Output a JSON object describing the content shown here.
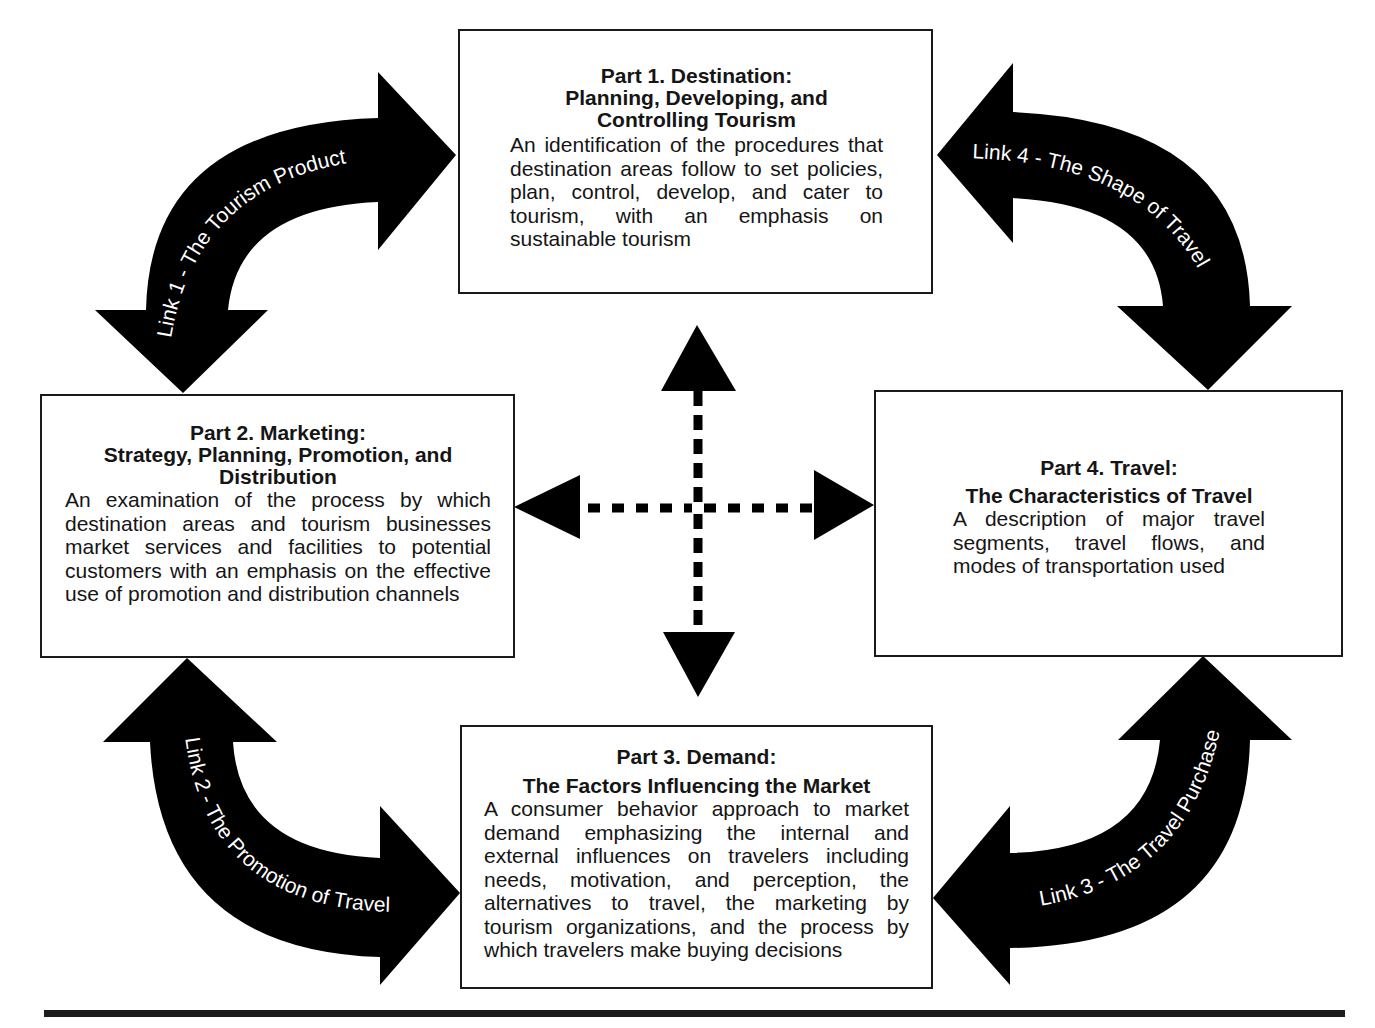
{
  "diagram": {
    "type": "framework",
    "parts": [
      {
        "id": "part1",
        "title": "Part 1. Destination:",
        "subtitle": "Planning, Developing, and Controlling Tourism",
        "subtitle_lines": [
          "Planning, Developing, and",
          "Controlling Tourism"
        ],
        "description": "An identification of the procedures that destination areas follow to set policies, plan, control, develop, and cater to tourism, with an emphasis on sustainable tourism"
      },
      {
        "id": "part2",
        "title": "Part 2. Marketing:",
        "subtitle": "Strategy, Planning, Promotion, and Distribution",
        "subtitle_lines": [
          "Strategy, Planning, Promotion, and",
          "Distribution"
        ],
        "description": "An examination of the process by which destination areas and tourism businesses market services and facilities to potential customers with an emphasis on the effective use of promotion and distribution channels"
      },
      {
        "id": "part3",
        "title": "Part 3. Demand:",
        "subtitle": "The Factors Influencing the Market",
        "subtitle_lines": [
          "The Factors Influencing the Market"
        ],
        "description": "A consumer behavior approach to market demand emphasizing the internal and external influences on travelers including needs, motivation, and perception, the alternatives to travel, the marketing by tourism organizations, and the process by which travelers make buying decisions"
      },
      {
        "id": "part4",
        "title": "Part 4. Travel:",
        "subtitle": "The Characteristics of Travel",
        "subtitle_lines": [
          "The Characteristics of Travel"
        ],
        "description": "A description of major travel segments, travel flows, and modes of transportation used"
      }
    ],
    "links": [
      {
        "id": "link1",
        "label": "Link 1 - The Tourism Product",
        "connects": [
          "Part 2",
          "Part 1"
        ],
        "arrow": "curved-double-headed"
      },
      {
        "id": "link2",
        "label": "Link 2 - The Promotion of Travel",
        "connects": [
          "Part 2",
          "Part 3"
        ],
        "arrow": "curved-double-headed"
      },
      {
        "id": "link3",
        "label": "Link 3 - The Travel Purchase",
        "connects": [
          "Part 3",
          "Part 4"
        ],
        "arrow": "curved-double-headed"
      },
      {
        "id": "link4",
        "label": "Link 4 - The Shape of Travel",
        "connects": [
          "Part 1",
          "Part 4"
        ],
        "arrow": "curved-double-headed"
      }
    ],
    "center_connector": {
      "style": "dashed-cross",
      "directions": [
        "up",
        "down",
        "left",
        "right"
      ]
    },
    "colors": {
      "arrow_fill": "#000000",
      "box_border": "#1a1a1a",
      "background": "#ffffff",
      "arrow_text": "#ffffff"
    }
  }
}
